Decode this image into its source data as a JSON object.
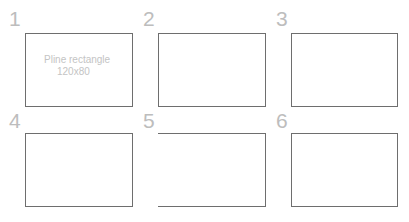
{
  "panels": [
    {
      "number": "1",
      "caption_line1": "Pline rectangle",
      "caption_line2": "120x80",
      "sides": "all"
    },
    {
      "number": "2",
      "sides": "all"
    },
    {
      "number": "3",
      "sides": "all"
    },
    {
      "number": "4",
      "sides": "all"
    },
    {
      "number": "5",
      "sides": "top-right-bottom (left side missing)"
    },
    {
      "number": "6",
      "sides": "all"
    }
  ],
  "colors": {
    "outline": "#6e6e6e",
    "label": "#bdbdbd",
    "caption": "#c4c4c4"
  }
}
